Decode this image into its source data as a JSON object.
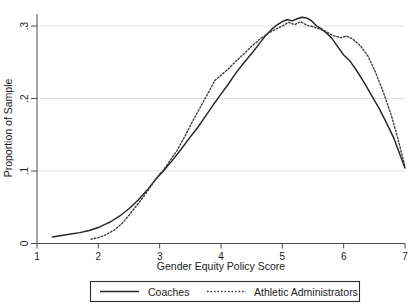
{
  "chart_data": {
    "type": "line",
    "title": "",
    "subtitle": "",
    "xlabel": "Gender Equity Policy Score",
    "ylabel": "Proportion of Sample",
    "xlim": [
      1,
      7
    ],
    "ylim": [
      0,
      0.32
    ],
    "xticks": [
      "1",
      "2",
      "3",
      "4",
      "5",
      "6",
      "7"
    ],
    "xtick_values": [
      1,
      2,
      3,
      4,
      5,
      6,
      7
    ],
    "yticks": [
      "0",
      ".1",
      ".2",
      ".3"
    ],
    "ytick_values": [
      0,
      0.1,
      0.2,
      0.3
    ],
    "grid": "horizontal",
    "legend_position": "below-axis",
    "series": [
      {
        "name": "Coaches",
        "style": "solid",
        "color": "#262626",
        "x": [
          1.25,
          1.4,
          1.55,
          1.7,
          1.85,
          2.0,
          2.1,
          2.2,
          2.35,
          2.5,
          2.65,
          2.8,
          2.95,
          3.05,
          3.2,
          3.35,
          3.5,
          3.62,
          3.75,
          3.88,
          4.0,
          4.12,
          4.25,
          4.38,
          4.5,
          4.62,
          4.72,
          4.82,
          4.92,
          5.0,
          5.08,
          5.16,
          5.24,
          5.32,
          5.4,
          5.48,
          5.56,
          5.64,
          5.72,
          5.8,
          5.9,
          6.0,
          6.1,
          6.2,
          6.32,
          6.45,
          6.58,
          6.7,
          6.82,
          6.92,
          7.0
        ],
        "y": [
          0.009,
          0.011,
          0.013,
          0.015,
          0.018,
          0.022,
          0.026,
          0.03,
          0.038,
          0.048,
          0.06,
          0.074,
          0.09,
          0.099,
          0.114,
          0.13,
          0.147,
          0.16,
          0.176,
          0.192,
          0.206,
          0.22,
          0.236,
          0.25,
          0.262,
          0.275,
          0.286,
          0.295,
          0.302,
          0.306,
          0.309,
          0.307,
          0.31,
          0.312,
          0.311,
          0.307,
          0.3,
          0.296,
          0.29,
          0.284,
          0.272,
          0.26,
          0.252,
          0.24,
          0.224,
          0.205,
          0.186,
          0.166,
          0.145,
          0.122,
          0.104
        ]
      },
      {
        "name": "Athletic Administrators",
        "style": "dotted",
        "color": "#3a3a3a",
        "x": [
          1.88,
          2.0,
          2.12,
          2.25,
          2.38,
          2.5,
          2.62,
          2.75,
          2.88,
          3.0,
          3.05,
          3.15,
          3.28,
          3.4,
          3.52,
          3.65,
          3.78,
          3.9,
          4.0,
          4.12,
          4.25,
          4.38,
          4.5,
          4.62,
          4.75,
          4.88,
          5.0,
          5.1,
          5.2,
          5.3,
          5.4,
          5.5,
          5.6,
          5.7,
          5.82,
          5.95,
          6.05,
          6.15,
          6.28,
          6.4,
          6.52,
          6.65,
          6.78,
          6.88,
          7.0
        ],
        "y": [
          0.006,
          0.008,
          0.012,
          0.018,
          0.027,
          0.039,
          0.052,
          0.066,
          0.082,
          0.096,
          0.1,
          0.112,
          0.128,
          0.146,
          0.166,
          0.186,
          0.206,
          0.225,
          0.232,
          0.241,
          0.252,
          0.262,
          0.272,
          0.281,
          0.289,
          0.295,
          0.3,
          0.305,
          0.302,
          0.306,
          0.301,
          0.299,
          0.296,
          0.293,
          0.287,
          0.284,
          0.286,
          0.282,
          0.272,
          0.258,
          0.236,
          0.208,
          0.176,
          0.146,
          0.106
        ]
      }
    ]
  },
  "axes": {
    "x_title": "Gender Equity Policy Score",
    "y_title": "Proportion of Sample",
    "x_tick_labels": [
      "1",
      "2",
      "3",
      "4",
      "5",
      "6",
      "7"
    ],
    "y_tick_labels": [
      "0",
      ".1",
      ".2",
      ".3"
    ]
  },
  "legend": {
    "entries": [
      {
        "label": "Coaches",
        "style": "solid"
      },
      {
        "label": "Athletic Administrators",
        "style": "dotted"
      }
    ]
  },
  "colors": {
    "series_solid": "#262626",
    "series_dotted": "#3a3a3a",
    "axis": "#4a4a4a",
    "grid": "#dcdcdc",
    "background": "#ffffff"
  }
}
